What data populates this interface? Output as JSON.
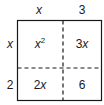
{
  "diagram": {
    "type": "area-model",
    "top_labels": [
      "x",
      "3"
    ],
    "side_labels": [
      "x",
      "2"
    ],
    "cells": [
      {
        "row": 0,
        "col": 0,
        "base": "x",
        "exp": "2"
      },
      {
        "row": 0,
        "col": 1,
        "coef": "3",
        "var": "x"
      },
      {
        "row": 1,
        "col": 0,
        "coef": "2",
        "var": "x"
      },
      {
        "row": 1,
        "col": 1,
        "value": "6"
      }
    ],
    "colors": {
      "stroke": "#1a1a1a",
      "background": "#ffffff"
    }
  }
}
